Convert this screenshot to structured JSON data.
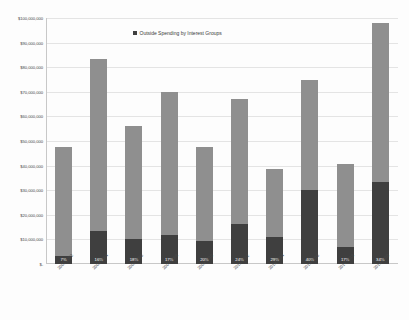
{
  "chart_data": {
    "type": "bar",
    "title": "",
    "subtitle": "",
    "xlabel": "",
    "ylabel": "",
    "grid": true,
    "legend_position": "top-center",
    "stacked": true,
    "ylim": [
      0,
      100000000
    ],
    "categories": [
      "2001-2002",
      "2003-2004",
      "2005-2006",
      "2007-2008",
      "2009-2010",
      "2011-2012",
      "2013-2014",
      "2015-2016",
      "2017-2018",
      "2019-2020"
    ],
    "ytick_labels": [
      "$100,000,000",
      "$90,000,000",
      "$80,000,000",
      "$70,000,000",
      "$60,000,000",
      "$50,000,000",
      "$40,000,000",
      "$30,000,000",
      "$20,000,000",
      "$10,000,000",
      "$-"
    ],
    "ytick_values": [
      100000000,
      90000000,
      80000000,
      70000000,
      60000000,
      50000000,
      40000000,
      30000000,
      20000000,
      10000000,
      0
    ],
    "legend": [
      {
        "name": "Outside Spending by Interest Groups",
        "color": "#3f3f3f"
      }
    ],
    "series": [
      {
        "name": "Outside Spending by Interest Groups",
        "color": "#3f3f3f",
        "values": [
          3325000,
          13360000,
          10080000,
          11900000,
          9500000,
          16080000,
          11165000,
          30000000,
          6885000,
          33320000
        ]
      },
      {
        "name": "Other Spending",
        "color": "#8f8f8f",
        "values": [
          44175000,
          70140000,
          45920000,
          58100000,
          38000000,
          50920000,
          27335000,
          45000000,
          33615000,
          64680000
        ]
      }
    ],
    "totals": [
      47500000,
      83500000,
      56000000,
      70000000,
      47500000,
      67000000,
      38500000,
      75000000,
      40500000,
      98000000
    ],
    "data_labels": [
      "7%",
      "16%",
      "18%",
      "17%",
      "20%",
      "24%",
      "29%",
      "40%",
      "17%",
      "34%"
    ],
    "percentages": [
      7,
      16,
      18,
      17,
      20,
      24,
      29,
      40,
      17,
      34
    ]
  }
}
